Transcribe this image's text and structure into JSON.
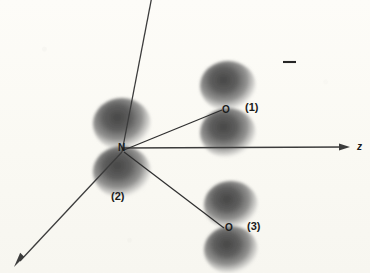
{
  "figure": {
    "kind": "molecular-orbital-diagram",
    "background_color": "#fcfbf6",
    "ink_color": "#2b2b2b",
    "lobe_color": "#5a5a5a",
    "axes": {
      "y": {
        "label": "",
        "name": "y-axis",
        "from": [
          152,
          155
        ],
        "to": [
          122,
          0
        ]
      },
      "z": {
        "label": "z",
        "name": "z-axis",
        "from": [
          122,
          148
        ],
        "to": [
          352,
          147
        ]
      },
      "x": {
        "label": "",
        "name": "x-axis",
        "from": [
          122,
          152
        ],
        "to": [
          14,
          266
        ]
      }
    },
    "atoms": [
      {
        "id": "N",
        "symbol": "N",
        "index_label": "(2)",
        "x": 122,
        "y": 148
      },
      {
        "id": "O1",
        "symbol": "O",
        "index_label": "(1)",
        "x": 226,
        "y": 110
      },
      {
        "id": "O3",
        "symbol": "O",
        "index_label": "(3)",
        "x": 228,
        "y": 228
      }
    ],
    "bonds": [
      {
        "from": "N",
        "to": "O1"
      },
      {
        "from": "N",
        "to": "O3"
      }
    ],
    "sign_marks": [
      {
        "name": "minus-sign-mark",
        "text": "—",
        "x": 283,
        "y": 61
      }
    ],
    "labels": {
      "nitrogen": "N",
      "oxygen_1": "O",
      "oxygen_3": "O",
      "index_1": "(1)",
      "index_2": "(2)",
      "index_3": "(3)",
      "axis_z": "z"
    }
  }
}
